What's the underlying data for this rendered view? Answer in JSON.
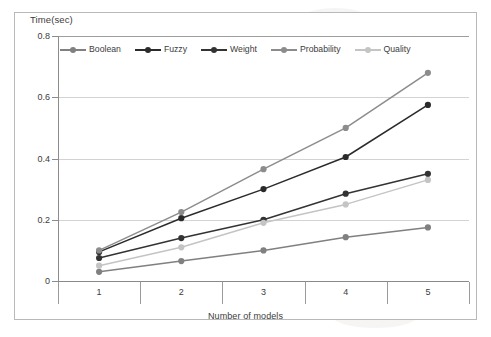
{
  "chart_data": {
    "type": "line",
    "title": "",
    "subtitle": "",
    "xlabel": "Number of models",
    "ylabel": "Time(sec)",
    "categories": [
      1,
      2,
      3,
      4,
      5
    ],
    "x": [
      1,
      2,
      3,
      4,
      5
    ],
    "xtick_labels": [
      "1",
      "2",
      "3",
      "4",
      "5"
    ],
    "ytick_labels": [
      "0",
      "0.2",
      "0.4",
      "0.6",
      "0.8"
    ],
    "ytick_values": [
      0,
      0.2,
      0.4,
      0.6,
      0.8
    ],
    "ylim": [
      0,
      0.8
    ],
    "xlim": [
      0.5,
      5.5
    ],
    "grid": "horizontal",
    "legend_position": "top-left-inside",
    "series": [
      {
        "name": "Boolean",
        "values": [
          0.03,
          0.065,
          0.1,
          0.143,
          0.175
        ],
        "color": "#808080",
        "marker": "circle"
      },
      {
        "name": "Fuzzy",
        "values": [
          0.095,
          0.205,
          0.3,
          0.405,
          0.575
        ],
        "color": "#2b2b2b",
        "marker": "circle"
      },
      {
        "name": "Weight",
        "values": [
          0.075,
          0.14,
          0.2,
          0.285,
          0.35
        ],
        "color": "#333333",
        "marker": "circle"
      },
      {
        "name": "Probability",
        "values": [
          0.1,
          0.225,
          0.365,
          0.5,
          0.68
        ],
        "color": "#8c8c8c",
        "marker": "circle"
      },
      {
        "name": "Quality",
        "values": [
          0.05,
          0.11,
          0.19,
          0.25,
          0.33
        ],
        "color": "#c4c4c4",
        "marker": "circle"
      }
    ]
  },
  "axis": {
    "y_title": "Time(sec)",
    "x_title": "Number of models"
  },
  "colors": {
    "grid": "#d3d3d3",
    "axis": "#8a8a8a",
    "frame": "#b9b9b9",
    "text": "#3c3c3c",
    "background": "#ffffff"
  }
}
